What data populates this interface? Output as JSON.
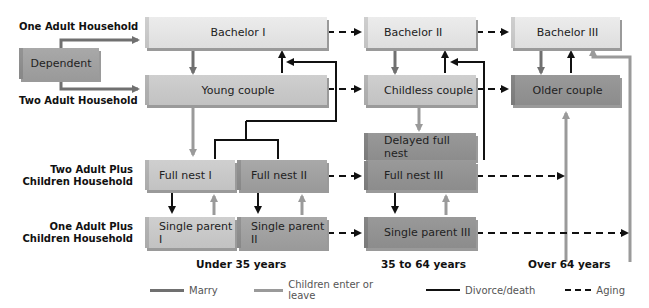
{
  "row_labels": {
    "one_adult": "One Adult Household",
    "two_adult": "Two Adult Household",
    "two_adult_children_line1": "Two Adult Plus",
    "two_adult_children_line2": "Children Household",
    "one_adult_children_line1": "One Adult Plus",
    "one_adult_children_line2": "Children Household"
  },
  "stages": {
    "dependent": "Dependent",
    "bachelor_1": "Bachelor I",
    "young_couple": "Young couple",
    "full_nest_1": "Full nest I",
    "full_nest_2": "Full nest II",
    "single_parent_1": "Single parent I",
    "single_parent_2": "Single parent II",
    "bachelor_2": "Bachelor II",
    "childless_couple": "Childless couple",
    "delayed_full_nest": "Delayed full nest",
    "full_nest_3": "Full nest III",
    "single_parent_3": "Single parent III",
    "bachelor_3": "Bachelor III",
    "older_couple": "Older couple"
  },
  "age_labels": {
    "under_35": "Under 35 years",
    "mid": "35 to 64 years",
    "over_64": "Over 64 years"
  },
  "legend": {
    "marry": "Marry",
    "children": "Children enter or leave",
    "divorce": "Divorce/death",
    "aging": "Aging"
  },
  "colors": {
    "marry": "#707070",
    "children": "#9a9a9a",
    "divorce": "#111111",
    "aging": "#111111"
  }
}
